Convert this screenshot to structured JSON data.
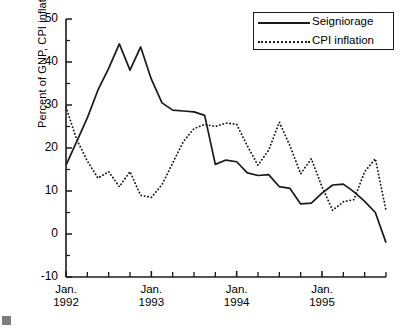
{
  "chart_data": {
    "type": "line",
    "title": "",
    "xlabel": "",
    "ylabel": "Percent of GNP, CPI inflation",
    "ylim": [
      -10,
      50
    ],
    "yticks": [
      -10,
      0,
      10,
      20,
      30,
      40,
      50
    ],
    "ytick_labels": [
      "-10",
      "0",
      "10",
      "20",
      "30",
      "40",
      "50"
    ],
    "yminor_step": 5,
    "grid": false,
    "legend_position": "top-right",
    "xlim": [
      0,
      15
    ],
    "xtick_labels": [
      "Jan.\n1992",
      "Jan.\n1993",
      "Jan.\n1994",
      "Jan.\n1995"
    ],
    "xtick_lines": [
      {
        "line1": "Jan.",
        "line2": "1992"
      },
      {
        "line1": "Jan.",
        "line2": "1993"
      },
      {
        "line1": "Jan.",
        "line2": "1994"
      },
      {
        "line1": "Jan.",
        "line2": "1995"
      }
    ],
    "xtick_positions": [
      0,
      4,
      8,
      12
    ],
    "xminor_step": 1,
    "x": [
      0,
      0.5,
      1,
      1.5,
      2,
      2.5,
      3,
      3.5,
      4,
      4.5,
      5,
      5.5,
      6,
      6.5,
      7,
      7.5,
      8,
      8.5,
      9,
      9.5,
      10,
      10.5,
      11,
      11.5,
      12,
      12.5,
      13,
      13.5,
      14,
      14.5,
      15
    ],
    "series": [
      {
        "name": "Seigniorage",
        "style": "solid",
        "color": "#1a1a1a",
        "values": [
          16.0,
          21.5,
          27.0,
          33.5,
          38.5,
          44.2,
          38.1,
          43.5,
          36.0,
          30.5,
          28.8,
          28.6,
          28.4,
          27.6,
          16.2,
          17.2,
          16.8,
          14.2,
          13.6,
          13.8,
          11.0,
          10.6,
          7.0,
          7.2,
          9.5,
          11.4,
          11.6,
          9.8,
          7.6,
          5.0,
          -2.0
        ]
      },
      {
        "name": "CPI inflation",
        "style": "dotted",
        "color": "#1a1a1a",
        "values": [
          29.5,
          22.0,
          17.0,
          13.0,
          14.5,
          11.0,
          14.5,
          9.0,
          8.5,
          11.5,
          16.5,
          21.5,
          24.5,
          25.5,
          25.0,
          25.8,
          25.5,
          20.5,
          16.0,
          19.5,
          26.0,
          20.5,
          14.0,
          17.5,
          11.0,
          5.5,
          7.5,
          8.0,
          14.5,
          17.5,
          5.5
        ]
      }
    ]
  },
  "legend": {
    "items": [
      {
        "label": "Seigniorage",
        "style": "solid"
      },
      {
        "label": "CPI inflation",
        "style": "dotted"
      }
    ]
  }
}
